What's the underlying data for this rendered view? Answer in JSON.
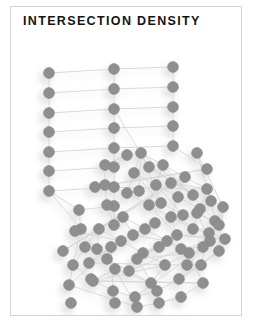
{
  "card": {
    "background": "#ffffff",
    "border_color": "#d4d4d4"
  },
  "header": {
    "title": "INTERSECTION DENSITY"
  },
  "chart_data": {
    "type": "scatter",
    "title": "INTERSECTION DENSITY",
    "subtitle": "",
    "xlabel": "",
    "ylabel": "",
    "grid": false,
    "legend": null,
    "node_color": "#8f8f8f",
    "node_edge_color": "#8a8a8a",
    "edge_color": "#d6d6d6",
    "shadow_color": "#cfcfcf",
    "node_radius": 5.4,
    "edge_width": 0.9,
    "xlim": [
      0,
      232
    ],
    "ylim": [
      0,
      310
    ],
    "node_count": 96,
    "edge_count": 152,
    "nodes": [
      [
        38,
        66
      ],
      [
        38,
        86
      ],
      [
        38,
        106
      ],
      [
        38,
        125
      ],
      [
        38,
        145
      ],
      [
        38,
        164
      ],
      [
        38,
        184
      ],
      [
        103,
        62
      ],
      [
        103,
        82
      ],
      [
        103,
        102
      ],
      [
        103,
        121
      ],
      [
        103,
        141
      ],
      [
        103,
        160
      ],
      [
        103,
        180
      ],
      [
        162,
        60
      ],
      [
        162,
        80
      ],
      [
        162,
        100
      ],
      [
        162,
        119
      ],
      [
        162,
        139
      ],
      [
        103,
        199
      ],
      [
        103,
        218
      ],
      [
        68,
        203
      ],
      [
        70,
        222
      ],
      [
        130,
        146
      ],
      [
        152,
        158
      ],
      [
        174,
        170
      ],
      [
        196,
        182
      ],
      [
        123,
        166
      ],
      [
        145,
        178
      ],
      [
        167,
        190
      ],
      [
        189,
        202
      ],
      [
        116,
        186
      ],
      [
        138,
        198
      ],
      [
        160,
        210
      ],
      [
        182,
        222
      ],
      [
        96,
        198
      ],
      [
        94,
        178
      ],
      [
        74,
        240
      ],
      [
        96,
        252
      ],
      [
        118,
        264
      ],
      [
        140,
        276
      ],
      [
        88,
        222
      ],
      [
        110,
        234
      ],
      [
        132,
        246
      ],
      [
        154,
        258
      ],
      [
        112,
        210
      ],
      [
        134,
        222
      ],
      [
        156,
        234
      ],
      [
        178,
        246
      ],
      [
        200,
        194
      ],
      [
        204,
        214
      ],
      [
        199,
        234
      ],
      [
        176,
        258
      ],
      [
        198,
        226
      ],
      [
        62,
        258
      ],
      [
        58,
        278
      ],
      [
        80,
        272
      ],
      [
        102,
        284
      ],
      [
        124,
        290
      ],
      [
        146,
        284
      ],
      [
        168,
        272
      ],
      [
        190,
        258
      ],
      [
        208,
        244
      ],
      [
        186,
        206
      ],
      [
        208,
        218
      ],
      [
        150,
        196
      ],
      [
        172,
        208
      ],
      [
        128,
        184
      ],
      [
        86,
        242
      ],
      [
        64,
        224
      ],
      [
        52,
        244
      ],
      [
        160,
        176
      ],
      [
        182,
        188
      ],
      [
        138,
        160
      ],
      [
        116,
        148
      ],
      [
        94,
        158
      ],
      [
        84,
        180
      ],
      [
        196,
        162
      ],
      [
        186,
        146
      ],
      [
        212,
        200
      ],
      [
        214,
        232
      ],
      [
        166,
        228
      ],
      [
        144,
        216
      ],
      [
        122,
        228
      ],
      [
        100,
        240
      ],
      [
        78,
        256
      ],
      [
        170,
        242
      ],
      [
        192,
        240
      ],
      [
        148,
        240
      ],
      [
        126,
        252
      ],
      [
        104,
        262
      ],
      [
        82,
        274
      ],
      [
        192,
        276
      ],
      [
        170,
        290
      ],
      [
        148,
        296
      ],
      [
        126,
        300
      ],
      [
        104,
        296
      ],
      [
        60,
        296
      ]
    ],
    "edges": [
      [
        0,
        1
      ],
      [
        1,
        2
      ],
      [
        2,
        3
      ],
      [
        3,
        4
      ],
      [
        4,
        5
      ],
      [
        5,
        6
      ],
      [
        7,
        8
      ],
      [
        8,
        9
      ],
      [
        9,
        10
      ],
      [
        10,
        11
      ],
      [
        11,
        12
      ],
      [
        12,
        13
      ],
      [
        14,
        15
      ],
      [
        15,
        16
      ],
      [
        16,
        17
      ],
      [
        17,
        18
      ],
      [
        0,
        7
      ],
      [
        1,
        8
      ],
      [
        2,
        9
      ],
      [
        3,
        10
      ],
      [
        4,
        11
      ],
      [
        5,
        12
      ],
      [
        6,
        13
      ],
      [
        7,
        14
      ],
      [
        8,
        15
      ],
      [
        9,
        16
      ],
      [
        10,
        17
      ],
      [
        11,
        18
      ],
      [
        13,
        19
      ],
      [
        19,
        20
      ],
      [
        21,
        22
      ],
      [
        6,
        21
      ],
      [
        21,
        19
      ],
      [
        23,
        24
      ],
      [
        24,
        25
      ],
      [
        25,
        26
      ],
      [
        27,
        28
      ],
      [
        28,
        29
      ],
      [
        29,
        30
      ],
      [
        31,
        32
      ],
      [
        32,
        33
      ],
      [
        33,
        34
      ],
      [
        23,
        27
      ],
      [
        24,
        28
      ],
      [
        25,
        29
      ],
      [
        26,
        30
      ],
      [
        27,
        31
      ],
      [
        28,
        32
      ],
      [
        29,
        33
      ],
      [
        30,
        34
      ],
      [
        35,
        36
      ],
      [
        19,
        35
      ],
      [
        36,
        31
      ],
      [
        37,
        38
      ],
      [
        38,
        39
      ],
      [
        39,
        40
      ],
      [
        41,
        42
      ],
      [
        42,
        43
      ],
      [
        43,
        44
      ],
      [
        45,
        46
      ],
      [
        46,
        47
      ],
      [
        47,
        48
      ],
      [
        37,
        41
      ],
      [
        38,
        42
      ],
      [
        39,
        43
      ],
      [
        40,
        44
      ],
      [
        41,
        45
      ],
      [
        42,
        46
      ],
      [
        43,
        47
      ],
      [
        44,
        48
      ],
      [
        49,
        50
      ],
      [
        50,
        51
      ],
      [
        26,
        49
      ],
      [
        30,
        49
      ],
      [
        52,
        53
      ],
      [
        51,
        52
      ],
      [
        34,
        53
      ],
      [
        54,
        55
      ],
      [
        22,
        54
      ],
      [
        54,
        37
      ],
      [
        56,
        57
      ],
      [
        57,
        58
      ],
      [
        58,
        59
      ],
      [
        59,
        60
      ],
      [
        60,
        61
      ],
      [
        61,
        62
      ],
      [
        63,
        64
      ],
      [
        49,
        63
      ],
      [
        63,
        51
      ],
      [
        65,
        66
      ],
      [
        23,
        65
      ],
      [
        65,
        27
      ],
      [
        67,
        31
      ],
      [
        67,
        23
      ],
      [
        68,
        69
      ],
      [
        22,
        68
      ],
      [
        68,
        41
      ],
      [
        70,
        71
      ],
      [
        25,
        70
      ],
      [
        71,
        26
      ],
      [
        72,
        73
      ],
      [
        73,
        9
      ],
      [
        72,
        23
      ],
      [
        74,
        75
      ],
      [
        75,
        36
      ],
      [
        74,
        12
      ],
      [
        76,
        77
      ],
      [
        77,
        18
      ],
      [
        76,
        26
      ],
      [
        78,
        79
      ],
      [
        49,
        78
      ],
      [
        79,
        51
      ],
      [
        80,
        81
      ],
      [
        33,
        80
      ],
      [
        81,
        32
      ],
      [
        82,
        83
      ],
      [
        46,
        82
      ],
      [
        83,
        45
      ],
      [
        84,
        85
      ],
      [
        55,
        84
      ],
      [
        85,
        52
      ],
      [
        86,
        87
      ],
      [
        51,
        86
      ],
      [
        87,
        53
      ],
      [
        88,
        89
      ],
      [
        47,
        88
      ],
      [
        89,
        48
      ],
      [
        90,
        91
      ],
      [
        91,
        92
      ],
      [
        92,
        93
      ],
      [
        93,
        94
      ],
      [
        94,
        95
      ],
      [
        95,
        55
      ],
      [
        40,
        90
      ],
      [
        44,
        91
      ],
      [
        48,
        92
      ],
      [
        53,
        61
      ],
      [
        62,
        60
      ],
      [
        79,
        62
      ],
      [
        20,
        35
      ],
      [
        13,
        36
      ],
      [
        6,
        22
      ],
      [
        57,
        84
      ],
      [
        58,
        87
      ],
      [
        59,
        89
      ],
      [
        39,
        86
      ],
      [
        43,
        88
      ],
      [
        56,
        54
      ],
      [
        64,
        24
      ],
      [
        66,
        28
      ],
      [
        69,
        42
      ],
      [
        71,
        70
      ],
      [
        73,
        72
      ],
      [
        75,
        74
      ],
      [
        77,
        76
      ],
      [
        81,
        80
      ],
      [
        83,
        82
      ],
      [
        85,
        84
      ],
      [
        87,
        86
      ],
      [
        89,
        88
      ],
      [
        90,
        95
      ],
      [
        91,
        90
      ],
      [
        92,
        91
      ],
      [
        94,
        93
      ],
      [
        62,
        79
      ],
      [
        61,
        52
      ],
      [
        50,
        63
      ],
      [
        33,
        81
      ],
      [
        47,
        83
      ]
    ]
  }
}
